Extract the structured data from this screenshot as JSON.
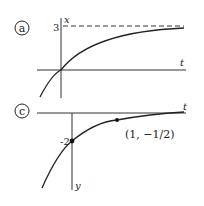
{
  "panels": [
    {
      "label": "a",
      "axis_v": "x",
      "axis_h": "t",
      "tick": "3"
    },
    {
      "label": "c",
      "axis_v": "y",
      "axis_h": "t",
      "tick": "-2",
      "point_label": "(1, −1/2)"
    }
  ]
}
